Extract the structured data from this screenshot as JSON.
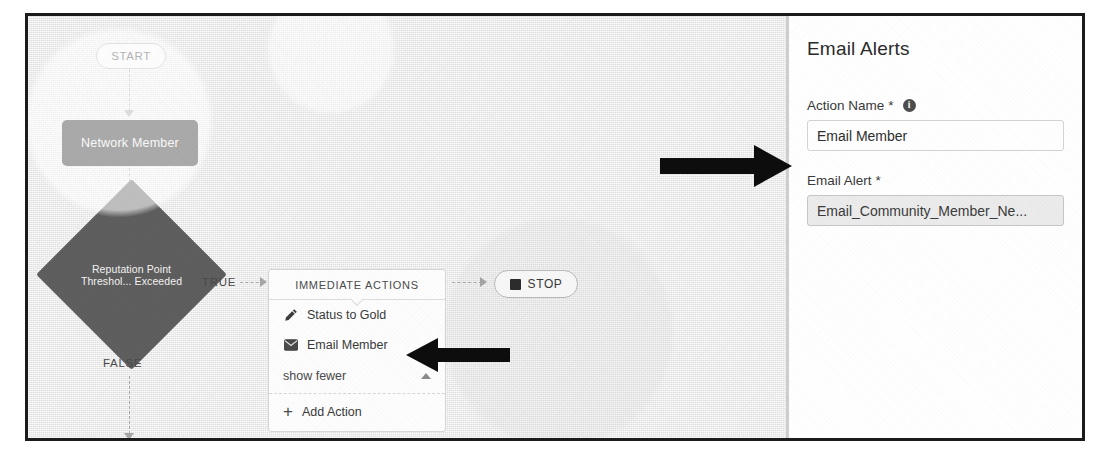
{
  "flow": {
    "start_label": "START",
    "object_node_label": "Network Member",
    "decision_label": "Reputation Point Threshol... Exceeded",
    "true_label": "TRUE",
    "false_label": "FALSE",
    "stop_label": "STOP",
    "actions_card": {
      "header": "IMMEDIATE ACTIONS",
      "items": [
        {
          "label": "Status to Gold",
          "icon": "pencil-icon"
        },
        {
          "label": "Email Member",
          "icon": "envelope-icon"
        }
      ],
      "show_fewer_label": "show fewer",
      "add_action_label": "Add Action",
      "add_action_icon": "plus-icon",
      "collapse_icon": "caret-up-icon"
    }
  },
  "panel": {
    "title": "Email Alerts",
    "fields": [
      {
        "label": "Action Name",
        "required_mark": "*",
        "info_icon": "info-icon",
        "info_glyph": "i",
        "value": "Email Member",
        "placeholder": "",
        "readonly": false
      },
      {
        "label": "Email Alert",
        "required_mark": "*",
        "value": "Email_Community_Member_Ne...",
        "placeholder": "",
        "readonly": true
      }
    ]
  },
  "annotations": {
    "arrow_to_panel": "right-arrow-annotation",
    "arrow_to_email_member": "left-arrow-annotation"
  },
  "colors": {
    "canvas_bg": "#e9e9e9",
    "node_dark": "#2b2b2b",
    "diamond": "#5e5e5e",
    "panel_bg": "#ffffff",
    "frame_border": "#1b1b1b",
    "readonly_field": "#ebebeb"
  }
}
